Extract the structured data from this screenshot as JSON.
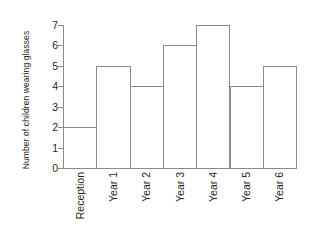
{
  "chart_data": {
    "type": "bar",
    "title": "",
    "xlabel": "",
    "ylabel": "Number of children wearing glasses",
    "categories": [
      "Reception",
      "Year 1",
      "Year 2",
      "Year 3",
      "Year 4",
      "Year 5",
      "Year 6"
    ],
    "values": [
      2,
      5,
      4,
      6,
      7,
      4,
      5
    ],
    "ylim": [
      0,
      7
    ],
    "yticks": [
      0,
      1,
      2,
      3,
      4,
      5,
      6,
      7
    ],
    "ytick_labels": [
      "0",
      "1",
      "2",
      "3",
      "4",
      "5",
      "6",
      "7"
    ],
    "grid": false,
    "legend": null,
    "series": [
      {
        "name": "Number of children wearing glasses",
        "values": [
          2,
          5,
          4,
          6,
          7,
          4,
          5
        ]
      }
    ],
    "colors": {
      "bar_fill": "#ffffff",
      "bar_stroke": "#8a8a8a",
      "axis": "#8a8a8a",
      "text": "#231f20",
      "background": "#ffffff"
    }
  }
}
